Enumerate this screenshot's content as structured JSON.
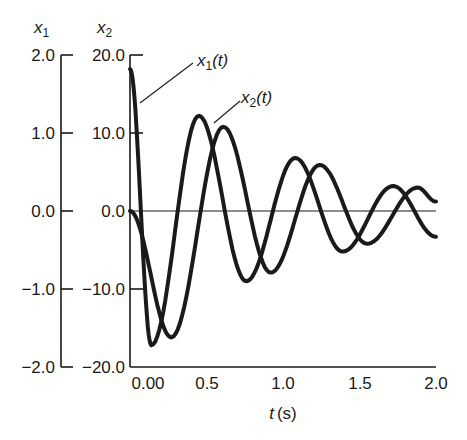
{
  "chart_data": {
    "type": "line",
    "title": "",
    "xlabel": "t (s)",
    "xlabel_var": "t",
    "xlabel_unit": "(s)",
    "ylabels": [
      {
        "var": "x",
        "sub": "1",
        "ticks": [
          "2.0",
          "1.0",
          "0.0",
          "−1.0",
          "−2.0"
        ],
        "range": [
          -2.0,
          2.0
        ]
      },
      {
        "var": "x",
        "sub": "2",
        "ticks": [
          "20.0",
          "10.0",
          "0.0",
          "−10.0",
          "−20.0"
        ],
        "range": [
          -20.0,
          20.0
        ]
      }
    ],
    "xticks": [
      "0.00",
      "0.5",
      "1.0",
      "1.5",
      "2.0"
    ],
    "xlim": [
      0,
      2.0
    ],
    "grid": false,
    "zero_line": true,
    "annotations": [
      {
        "text_var": "x",
        "text_sub": "1",
        "text_arg": "(t)",
        "points_to": "x1 curve near t=0.05"
      },
      {
        "text_var": "x",
        "text_sub": "2",
        "text_arg": "(t)",
        "points_to": "x2 curve near t=0.5"
      }
    ],
    "series": [
      {
        "name": "x1(t)",
        "axis": "x1 (scaled ×10 on x2 axis)",
        "x": [
          0.0,
          0.14,
          0.45,
          0.76,
          1.08,
          1.39,
          1.72,
          2.0
        ],
        "y_on_x2_scale": [
          18.2,
          -17.2,
          12.2,
          -9.0,
          6.8,
          -5.2,
          3.2,
          -3.3
        ]
      },
      {
        "name": "x2(t)",
        "axis": "x2",
        "x": [
          0.0,
          0.27,
          0.61,
          0.92,
          1.24,
          1.55,
          1.88,
          2.0
        ],
        "y_on_x2_scale": [
          0.0,
          -16.2,
          10.8,
          -7.9,
          5.9,
          -4.2,
          3.0,
          1.2
        ]
      }
    ]
  },
  "labels": {
    "y1_var": "x",
    "y1_sub": "1",
    "y2_var": "x",
    "y2_sub": "2",
    "ann1_var": "x",
    "ann1_sub": "1",
    "ann1_arg": "(t)",
    "ann2_var": "x",
    "ann2_sub": "2",
    "ann2_arg": "(t)",
    "xlabel_var": "t",
    "xlabel_unit": "(s)"
  }
}
